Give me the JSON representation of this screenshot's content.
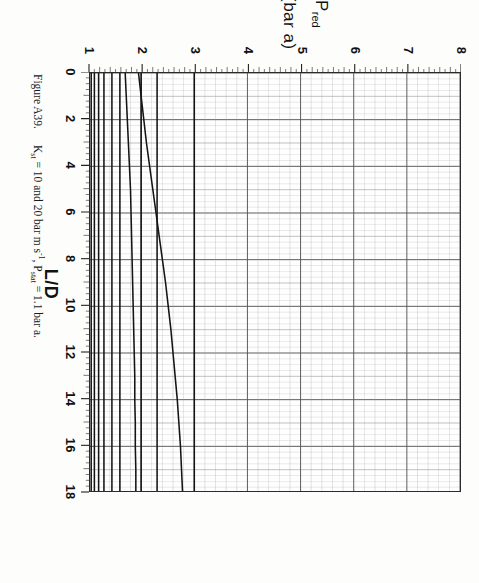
{
  "figure": {
    "caption_number": "Figure A39.",
    "caption_text_parts": {
      "kst_symbol": "K",
      "kst_sub": "st",
      "kst_value": " = 10 and 20 bar m s",
      "kst_sup": "-1",
      "comma": ", P",
      "pstat_sub": "stat",
      "pstat_value": " = 1.1 bar a."
    },
    "caption_full": "Figure A39.    Kst = 10 and 20 bar m s-1, Pstat = 1.1 bar a.",
    "rotation_deg": 90,
    "paper_color": "#fdfdfc",
    "ink_color": "#2b2b2b"
  },
  "chart_data": {
    "type": "line",
    "title": "",
    "xlabel": "L/D",
    "ylabel": "P red (bar a)",
    "ylabel_main": "P",
    "ylabel_sub": "red",
    "ylabel_units": "(bar a)",
    "xlim": [
      0,
      18
    ],
    "ylim": [
      1,
      8
    ],
    "xticks": [
      0,
      2,
      4,
      6,
      8,
      10,
      12,
      14,
      16,
      18
    ],
    "xtick_labels": [
      "0",
      "2",
      "4",
      "6",
      "8",
      "10",
      "12",
      "14",
      "16",
      "18"
    ],
    "yticks": [
      1,
      2,
      3,
      4,
      5,
      6,
      7,
      8
    ],
    "ytick_labels": [
      "1",
      "2",
      "3",
      "4",
      "5",
      "6",
      "7",
      "8"
    ],
    "x_minor_step": 0.25,
    "y_minor_step": 0.2,
    "grid": true,
    "grid_major_color": "#555555",
    "grid_minor_color": "#9a9a9a",
    "legend": "none",
    "x": [
      0,
      1,
      2,
      3,
      4,
      5,
      6,
      7,
      8,
      9,
      10,
      11,
      12,
      13,
      14,
      15,
      16,
      17,
      18
    ],
    "series": [
      {
        "name": "curve-1",
        "values": [
          3.0,
          3.0,
          3.0,
          3.0,
          3.0,
          3.0,
          3.0,
          3.0,
          3.0,
          3.0,
          3.0,
          3.0,
          3.0,
          3.0,
          3.0,
          3.0,
          3.0,
          3.0,
          3.0
        ]
      },
      {
        "name": "curve-2",
        "values": [
          2.3,
          2.3,
          2.3,
          2.3,
          2.3,
          2.3,
          2.3,
          2.3,
          2.3,
          2.3,
          2.3,
          2.3,
          2.3,
          2.3,
          2.3,
          2.3,
          2.3,
          2.3,
          2.3
        ]
      },
      {
        "name": "curve-3",
        "values": [
          1.95,
          2.0,
          2.05,
          2.1,
          2.16,
          2.22,
          2.28,
          2.34,
          2.4,
          2.46,
          2.51,
          2.56,
          2.6,
          2.64,
          2.68,
          2.71,
          2.74,
          2.76,
          2.78
        ]
      },
      {
        "name": "curve-4",
        "values": [
          2.0,
          2.0,
          2.0,
          2.0,
          2.0,
          2.0,
          2.0,
          2.0,
          2.0,
          2.0,
          2.0,
          2.0,
          2.0,
          2.0,
          2.0,
          2.0,
          2.0,
          2.0,
          2.0
        ]
      },
      {
        "name": "curve-5",
        "values": [
          1.7,
          1.72,
          1.74,
          1.76,
          1.78,
          1.8,
          1.81,
          1.82,
          1.83,
          1.84,
          1.85,
          1.86,
          1.87,
          1.88,
          1.88,
          1.89,
          1.89,
          1.9,
          1.9
        ]
      },
      {
        "name": "curve-6",
        "values": [
          1.6,
          1.6,
          1.6,
          1.6,
          1.6,
          1.6,
          1.6,
          1.6,
          1.6,
          1.6,
          1.6,
          1.6,
          1.6,
          1.6,
          1.6,
          1.6,
          1.6,
          1.6,
          1.6
        ]
      },
      {
        "name": "curve-7",
        "values": [
          1.45,
          1.45,
          1.45,
          1.45,
          1.45,
          1.45,
          1.45,
          1.45,
          1.45,
          1.45,
          1.45,
          1.45,
          1.45,
          1.45,
          1.45,
          1.45,
          1.45,
          1.45,
          1.45
        ]
      },
      {
        "name": "curve-8",
        "values": [
          1.3,
          1.3,
          1.3,
          1.3,
          1.3,
          1.3,
          1.3,
          1.3,
          1.3,
          1.3,
          1.3,
          1.3,
          1.3,
          1.3,
          1.3,
          1.3,
          1.3,
          1.3,
          1.3
        ]
      },
      {
        "name": "curve-9",
        "values": [
          1.2,
          1.2,
          1.2,
          1.2,
          1.2,
          1.2,
          1.2,
          1.2,
          1.2,
          1.2,
          1.2,
          1.2,
          1.2,
          1.2,
          1.2,
          1.2,
          1.2,
          1.2,
          1.2
        ]
      },
      {
        "name": "curve-10",
        "values": [
          1.12,
          1.12,
          1.12,
          1.12,
          1.12,
          1.12,
          1.12,
          1.12,
          1.12,
          1.12,
          1.12,
          1.12,
          1.12,
          1.12,
          1.12,
          1.12,
          1.12,
          1.12,
          1.12
        ]
      },
      {
        "name": "curve-11",
        "values": [
          1.06,
          1.06,
          1.06,
          1.06,
          1.06,
          1.06,
          1.06,
          1.06,
          1.06,
          1.06,
          1.06,
          1.06,
          1.06,
          1.06,
          1.06,
          1.06,
          1.06,
          1.06,
          1.06
        ]
      }
    ]
  }
}
